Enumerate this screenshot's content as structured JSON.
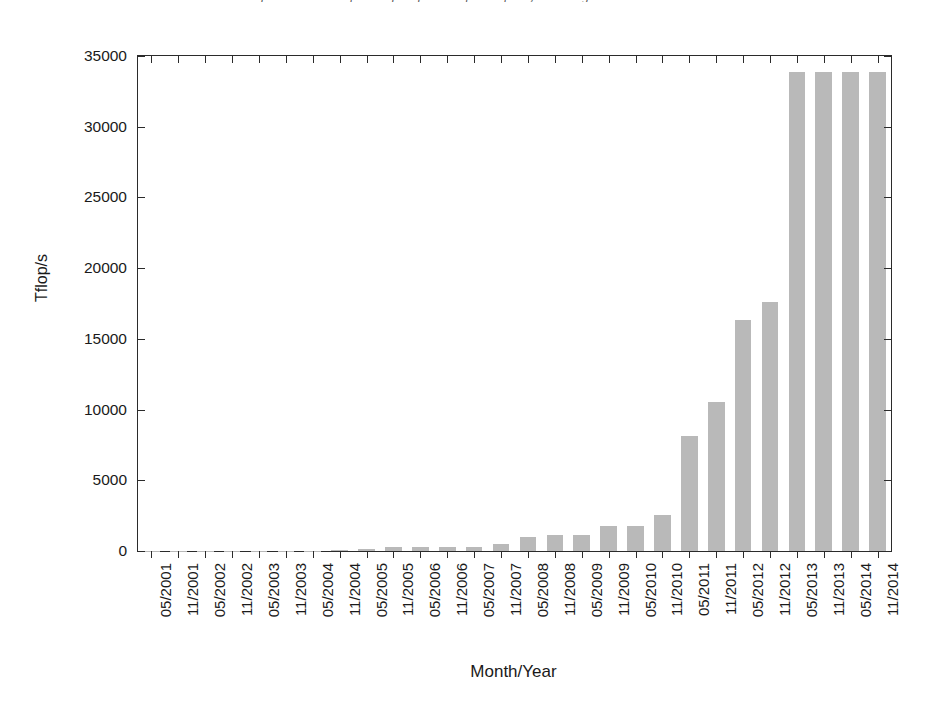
{
  "chart_data": {
    "type": "bar",
    "title": "Performance Development of the fastest supercomputer, according to the TOP500 list",
    "xlabel": "Month/Year",
    "ylabel": "Tflop/s",
    "ylim": [
      0,
      35000
    ],
    "yticks": [
      0,
      5000,
      10000,
      15000,
      20000,
      25000,
      30000,
      35000
    ],
    "ytick_labels": [
      "0",
      "5000",
      "10000",
      "15000",
      "20000",
      "25000",
      "30000",
      "35000"
    ],
    "grid": false,
    "legend": null,
    "bar_color": "#b9b9b9",
    "axis_color": "#2b2b2b",
    "categories": [
      "05/2001",
      "11/2001",
      "05/2002",
      "11/2002",
      "05/2003",
      "11/2003",
      "05/2004",
      "11/2004",
      "05/2005",
      "11/2005",
      "05/2006",
      "11/2006",
      "05/2007",
      "11/2007",
      "05/2008",
      "11/2008",
      "05/2009",
      "11/2009",
      "05/2010",
      "11/2010",
      "05/2011",
      "11/2011",
      "05/2012",
      "11/2012",
      "05/2013",
      "11/2013",
      "05/2014",
      "11/2014"
    ],
    "values": [
      7,
      7,
      36,
      36,
      36,
      36,
      36,
      70,
      137,
      281,
      281,
      281,
      281,
      478,
      1026,
      1105,
      1105,
      1759,
      1759,
      2566,
      8162,
      10510,
      16325,
      17590,
      33863,
      33863,
      33863,
      33863
    ]
  }
}
